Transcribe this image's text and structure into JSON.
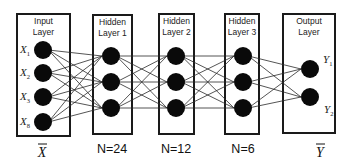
{
  "diagram": {
    "type": "feedforward-neural-network",
    "layers": [
      {
        "id": "input",
        "title_line1": "Input",
        "title_line2": "Layer",
        "box": {
          "x": 17,
          "y": 14,
          "w": 53,
          "h": 122
        },
        "node_x": 43,
        "node_y": [
          50,
          73,
          97,
          122
        ],
        "node_labels": [
          {
            "base": "X",
            "sub": "1"
          },
          {
            "base": "X",
            "sub": "2"
          },
          {
            "base": "X",
            "sub": "3"
          },
          {
            "base": "X",
            "sub": "8"
          }
        ],
        "bottom_label": "X",
        "bottom_label_has_bar": true,
        "bottom_label_x": 42
      },
      {
        "id": "hidden1",
        "title_line1": "Hidden",
        "title_line2": "Layer 1",
        "box": {
          "x": 93,
          "y": 15,
          "w": 39,
          "h": 119
        },
        "node_x": 111,
        "node_y": [
          56,
          82,
          108
        ],
        "bottom_label": "N=24",
        "bottom_label_x": 112
      },
      {
        "id": "hidden2",
        "title_line1": "Hidden",
        "title_line2": "Layer 2",
        "box": {
          "x": 159,
          "y": 14,
          "w": 35,
          "h": 120
        },
        "node_x": 176,
        "node_y": [
          56,
          82,
          108
        ],
        "bottom_label": "N=12",
        "bottom_label_x": 176
      },
      {
        "id": "hidden3",
        "title_line1": "Hidden",
        "title_line2": "Layer 3",
        "box": {
          "x": 225,
          "y": 14,
          "w": 34,
          "h": 120
        },
        "node_x": 243,
        "node_y": [
          56,
          82,
          108
        ],
        "bottom_label": "N=6",
        "bottom_label_x": 243
      },
      {
        "id": "output",
        "title_line1": "Output",
        "title_line2": "Layer",
        "box": {
          "x": 283,
          "y": 14,
          "w": 52,
          "h": 119
        },
        "node_x": 310,
        "node_y": [
          69,
          97
        ],
        "node_labels_right": [
          {
            "base": "Y",
            "sub": "1",
            "x": 323,
            "y": 63
          },
          {
            "base": "Y",
            "sub": "2",
            "x": 324,
            "y": 113
          }
        ],
        "bottom_label": "Y",
        "bottom_label_has_bar": true,
        "bottom_label_x": 320
      }
    ],
    "node_radius": 9,
    "connectivity": "fully-connected",
    "colors": {
      "node": "#0a0a0a",
      "edge": "#2a2a2a",
      "box_stroke": "#1a1a1a",
      "background": "#ffffff"
    }
  }
}
